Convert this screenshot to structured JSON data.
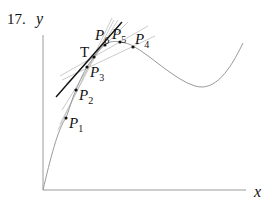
{
  "problem_number": "17.",
  "axes": {
    "y_label": "y",
    "x_label": "x"
  },
  "tangent_point": {
    "label": "T"
  },
  "points": [
    {
      "name": "P",
      "sub": "1"
    },
    {
      "name": "P",
      "sub": "2"
    },
    {
      "name": "P",
      "sub": "3"
    },
    {
      "name": "P",
      "sub": "4"
    },
    {
      "name": "P",
      "sub": "5"
    },
    {
      "name": "P",
      "sub": "6"
    }
  ],
  "colors": {
    "curve": "#9a9a9a",
    "tangent": "#111111",
    "secants": "#b8b8b8",
    "axes": "#9a9a9a"
  }
}
